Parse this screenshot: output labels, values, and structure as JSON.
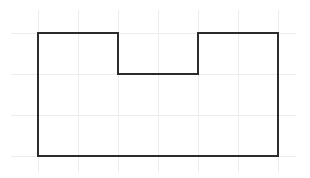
{
  "diagram": {
    "type": "polygon-on-grid",
    "colors": {
      "background": "#ffffff",
      "grid": "#ececec",
      "outline": "#2b2b2b"
    },
    "grid": {
      "origin_px": [
        38,
        156
      ],
      "unit_px_x": 40,
      "unit_px_y": 41,
      "columns": [
        0,
        1,
        2,
        3,
        4,
        5,
        6
      ],
      "rows": [
        0,
        1,
        2,
        3
      ],
      "extent_px": {
        "x_min": 11,
        "x_max": 296,
        "y_min": 10,
        "y_max": 172
      }
    },
    "shape": {
      "name": "notched-rectangle",
      "points_grid": [
        [
          0,
          3
        ],
        [
          2,
          3
        ],
        [
          2,
          2
        ],
        [
          4,
          2
        ],
        [
          4,
          3
        ],
        [
          6,
          3
        ],
        [
          6,
          0
        ],
        [
          0,
          0
        ]
      ],
      "stroke_width": 2
    }
  }
}
